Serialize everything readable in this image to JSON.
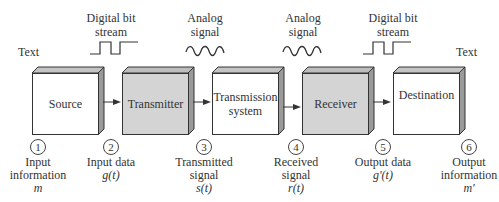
{
  "top": {
    "text_left": "Text",
    "text_right": "Text",
    "signals": [
      {
        "line1": "Digital bit",
        "line2": "stream",
        "type": "digital"
      },
      {
        "line1": "Analog",
        "line2": "signal",
        "type": "analog"
      },
      {
        "line1": "Analog",
        "line2": "signal",
        "type": "analog"
      },
      {
        "line1": "Digital bit",
        "line2": "stream",
        "type": "digital"
      }
    ]
  },
  "blocks": [
    {
      "label": "Source",
      "fill": "white"
    },
    {
      "label": "Transmitter",
      "fill": "gray"
    },
    {
      "label": "Transmission system",
      "line1": "Transmission",
      "line2": "system",
      "fill": "white"
    },
    {
      "label": "Receiver",
      "fill": "gray"
    },
    {
      "label": "Destination",
      "fill": "white"
    }
  ],
  "nodes": [
    {
      "num": "1",
      "line1": "Input",
      "line2": "information",
      "symbol": "m"
    },
    {
      "num": "2",
      "line1": "Input data",
      "symbol": "g(t)"
    },
    {
      "num": "3",
      "line1": "Transmitted",
      "line2": "signal",
      "symbol": "s(t)"
    },
    {
      "num": "4",
      "line1": "Received",
      "line2": "signal",
      "symbol": "r(t)"
    },
    {
      "num": "5",
      "line1": "Output data",
      "symbol": "g'(t)"
    },
    {
      "num": "6",
      "line1": "Output",
      "line2": "information",
      "symbol": "m'"
    }
  ],
  "colors": {
    "gray_fill": "#d4d4d4",
    "side_fill": "#9a9a9a",
    "top_fill": "#c4c4c4",
    "line": "#333333"
  }
}
